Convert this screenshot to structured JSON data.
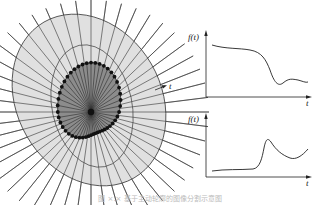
{
  "diagram": {
    "ray_label": "t",
    "colors": {
      "outer_region": "#e0e0e0",
      "inner_region": "#8c8c8c",
      "line": "#333333",
      "dot": "#1a1a1a"
    },
    "ray_count": 48
  },
  "plots": [
    {
      "ylabel": "f(t)",
      "xlabel": "t",
      "description": "high plateau then drop, small dip and recovery"
    },
    {
      "ylabel": "f(t)",
      "xlabel": "t",
      "description": "low flat then sharp peak, decay and rise"
    }
  ],
  "caption": "图 ×.× 基于主动轮廓的图像分割示意图"
}
